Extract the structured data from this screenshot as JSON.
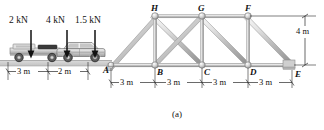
{
  "figure": {
    "caption": "(a)",
    "scene": "two vehicles on roadway approaching a steel truss bridge"
  },
  "loads": [
    {
      "id": "load-2kn",
      "label": "2 kN",
      "x": 9,
      "y": 17,
      "arrow_x": 31,
      "arrow_top": 30,
      "arrow_bottom": 58
    },
    {
      "id": "load-4kn",
      "label": "4 kN",
      "x": 46,
      "y": 17,
      "arrow_x": 67,
      "arrow_top": 30,
      "arrow_bottom": 58
    },
    {
      "id": "load-1p5kn",
      "label": "1.5 kN",
      "x": 76,
      "y": 17,
      "arrow_x": 95,
      "arrow_top": 30,
      "arrow_bottom": 58
    }
  ],
  "vehicles": [
    {
      "id": "flatbed-truck",
      "name": "flatbed-truck"
    },
    {
      "id": "car",
      "name": "car"
    }
  ],
  "truss": {
    "top_nodes": [
      {
        "label": "H",
        "x": 155,
        "y": 16
      },
      {
        "label": "G",
        "x": 202,
        "y": 16
      },
      {
        "label": "F",
        "x": 248,
        "y": 16
      }
    ],
    "bottom_nodes": [
      {
        "label": "A",
        "x": 111,
        "y": 65
      },
      {
        "label": "B",
        "x": 155,
        "y": 65
      },
      {
        "label": "C",
        "x": 202,
        "y": 65
      },
      {
        "label": "D",
        "x": 248,
        "y": 65
      },
      {
        "label": "E",
        "x": 292,
        "y": 65
      }
    ]
  },
  "dimensions": {
    "approach": [
      {
        "id": "dim-3m-truck",
        "label": "3 m",
        "text_x": 22,
        "text_y": 73
      },
      {
        "id": "dim-2m-truck",
        "label": "2 m",
        "text_x": 67,
        "text_y": 73
      }
    ],
    "spans": [
      {
        "id": "dim-3m-ab",
        "label": "3 m",
        "text_x": 124,
        "text_y": 84
      },
      {
        "id": "dim-3m-bc",
        "label": "3 m",
        "text_x": 170,
        "text_y": 84
      },
      {
        "id": "dim-3m-cd",
        "label": "3 m",
        "text_x": 217,
        "text_y": 84
      },
      {
        "id": "dim-3m-de",
        "label": "3 m",
        "text_x": 263,
        "text_y": 84
      }
    ],
    "height": {
      "id": "dim-4m",
      "label": "4 m",
      "text_x": 299,
      "text_y": 31
    }
  },
  "colors": {
    "line": "#1a1a1a",
    "member_light": "#e8e8e8",
    "member_mid": "#bdbdbd",
    "member_dark": "#8f8f8f",
    "road": "#d9d9d9",
    "vehicle_body": "#c9c9c9",
    "vehicle_dark": "#6e6e6e",
    "text": "#111111"
  }
}
